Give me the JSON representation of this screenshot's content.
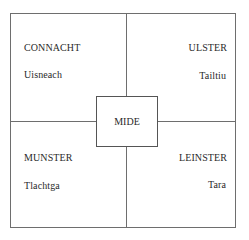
{
  "diagram": {
    "center": {
      "label": "MIDE"
    },
    "quadrants": [
      {
        "position": "top-left",
        "province": "CONNACHT",
        "site": "Uisneach"
      },
      {
        "position": "top-right",
        "province": "ULSTER",
        "site": "Tailtiu"
      },
      {
        "position": "bottom-left",
        "province": "MUNSTER",
        "site": "Tlachtga"
      },
      {
        "position": "bottom-right",
        "province": "LEINSTER",
        "site": "Tara"
      }
    ],
    "colors": {
      "lines": "#6e6e6e",
      "text": "#2a2a2a",
      "background": "#ffffff"
    }
  }
}
